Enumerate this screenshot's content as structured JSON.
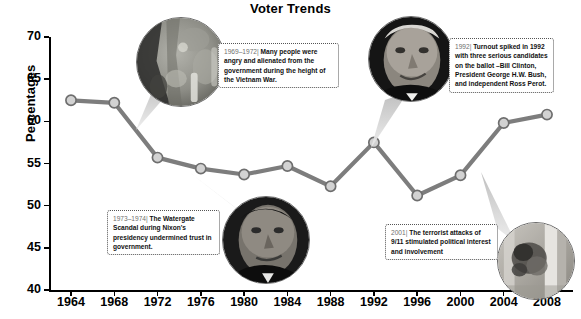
{
  "chart_data": {
    "type": "line",
    "title": "Voter Trends",
    "xlabel": "",
    "ylabel": "Percentages",
    "categories": [
      1964,
      1968,
      1972,
      1976,
      1980,
      1984,
      1988,
      1992,
      1996,
      2000,
      2004,
      2008
    ],
    "tick_labels_x": [
      "1964",
      "1968",
      "1972",
      "1976",
      "1980",
      "1984",
      "1988",
      "1992",
      "1996",
      "2000",
      "2004",
      "2008"
    ],
    "tick_labels_y": [
      "40",
      "45",
      "50",
      "55",
      "60",
      "65",
      "70"
    ],
    "ylim": [
      40,
      70
    ],
    "yticks": [
      40,
      45,
      50,
      55,
      60,
      65,
      70
    ],
    "grid": false,
    "legend": false,
    "series": [
      {
        "name": "Voter turnout",
        "values": [
          62.5,
          62.2,
          55.7,
          54.4,
          53.7,
          54.7,
          52.3,
          57.5,
          51.2,
          53.6,
          59.8,
          60.8
        ]
      }
    ],
    "annotations": [
      {
        "id": "vietnam",
        "year_label": "1969–1972|",
        "text": "Many people were angry and alienated from the government during the height of the Vietnam War.",
        "points_to_year": 1972,
        "photo": "vietnam-war-photo"
      },
      {
        "id": "watergate",
        "year_label": "1973–1974|",
        "text": "The Watergate Scandal during Nixon's presidency undermined trust in government.",
        "points_to_year": 1976,
        "photo": "richard-nixon-photo"
      },
      {
        "id": "clinton",
        "year_label": "1992|",
        "text": "Turnout spiked in 1992 with three serious candidates on the ballot –Bill Clinton, President George H.W. Bush, and independent Ross Perot.",
        "points_to_year": 1992,
        "photo": "bill-clinton-photo"
      },
      {
        "id": "sept11",
        "year_label": "2001|",
        "text": "The terrorist attacks of 9/11 stimulated political interest and involvement",
        "points_to_year": 2004,
        "photo": "september-11-photo"
      }
    ],
    "colors": {
      "line": "#7d7d7d",
      "marker_fill": "#d2d2d2",
      "marker_stroke": "#6e6e6e",
      "axis": "#000000",
      "callout_border": "#555555",
      "callout_year_text": "#6f6f6f"
    }
  }
}
